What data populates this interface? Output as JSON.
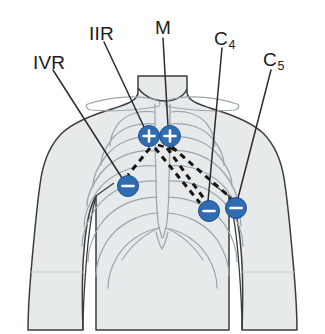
{
  "figure": {
    "background_color": "#ffffff",
    "body_fill": "#e7eaea",
    "body_stroke": "#3c3c3c",
    "bone_stroke": "#9aa6ae",
    "electrode_color": "#2f6cb3",
    "electrode_stroke": "#1d4e8c",
    "leader_color": "#2b2b2b",
    "vector_color": "#141414"
  },
  "labels": [
    {
      "id": "ivr",
      "text": "IVR",
      "sub": "",
      "x": 33,
      "y": 53,
      "name": "label-ivr"
    },
    {
      "id": "iir",
      "text": "IIR",
      "sub": "",
      "x": 89,
      "y": 24,
      "name": "label-iir"
    },
    {
      "id": "m",
      "text": "M",
      "sub": "",
      "x": 155,
      "y": 18,
      "name": "label-m"
    },
    {
      "id": "c4",
      "text": "C",
      "sub": "4",
      "x": 214,
      "y": 29,
      "name": "label-c4"
    },
    {
      "id": "c5",
      "text": "C",
      "sub": "5",
      "x": 263,
      "y": 50,
      "name": "label-c5"
    }
  ],
  "electrodes": [
    {
      "id": "e-plus-left",
      "polarity": "+",
      "x": 149,
      "y": 136,
      "r": 10.5,
      "name": "electrode-positive-left"
    },
    {
      "id": "e-plus-right",
      "polarity": "+",
      "x": 170,
      "y": 136,
      "r": 10.5,
      "name": "electrode-positive-right"
    },
    {
      "id": "e-minus-left",
      "polarity": "−",
      "x": 128,
      "y": 186,
      "r": 10.5,
      "name": "electrode-negative-left"
    },
    {
      "id": "e-minus-mid",
      "polarity": "−",
      "x": 209,
      "y": 211,
      "r": 10.5,
      "name": "electrode-negative-middle"
    },
    {
      "id": "e-minus-right",
      "polarity": "−",
      "x": 236,
      "y": 208,
      "r": 10.5,
      "name": "electrode-negative-right"
    }
  ],
  "leader_lines": [
    {
      "id": "lead-ivr",
      "from_label": "IVR",
      "x1": 53,
      "y1": 70,
      "x2": 122,
      "y2": 178,
      "name": "leader-line-ivr"
    },
    {
      "id": "lead-iir",
      "from_label": "IIR",
      "x1": 104,
      "y1": 42,
      "x2": 144,
      "y2": 127,
      "name": "leader-line-iir"
    },
    {
      "id": "lead-m",
      "from_label": "M",
      "x1": 163,
      "y1": 38,
      "x2": 168,
      "y2": 126,
      "name": "leader-line-m"
    },
    {
      "id": "lead-c4",
      "from_label": "C4",
      "x1": 222,
      "y1": 48,
      "x2": 208,
      "y2": 201,
      "name": "leader-line-c4"
    },
    {
      "id": "lead-c5",
      "from_label": "C5",
      "x1": 271,
      "y1": 70,
      "x2": 238,
      "y2": 198,
      "name": "leader-line-c5"
    }
  ],
  "vectors": [
    {
      "id": "vec-iir-ivr",
      "from": "e-plus-left",
      "to": "e-minus-left",
      "name": "vector-iir-to-ivr"
    },
    {
      "id": "vec-m-mid",
      "from": "e-plus-right",
      "to": "e-minus-mid",
      "name": "vector-m-to-c4"
    },
    {
      "id": "vec-m-right",
      "from": "e-plus-right",
      "to": "e-minus-right",
      "name": "vector-m-to-c5"
    },
    {
      "id": "vec-cross",
      "from": "e-plus-left",
      "to": "e-minus-mid",
      "name": "vector-cross"
    }
  ],
  "anatomy": {
    "parts": [
      "neck",
      "shoulders",
      "clavicles",
      "sternum",
      "ribs",
      "xiphoid",
      "arms",
      "waist"
    ]
  }
}
